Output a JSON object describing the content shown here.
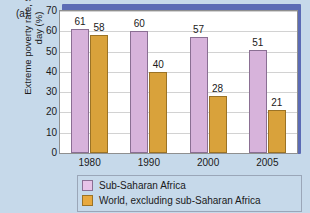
{
  "panel": {
    "label": "(a)"
  },
  "chart_data": {
    "type": "bar",
    "title": "",
    "xlabel": "",
    "ylabel": "Extreme poverty rate, $1.25 per day (%)",
    "categories": [
      "1980",
      "1990",
      "2000",
      "2005"
    ],
    "series": [
      {
        "name": "Sub-Saharan Africa",
        "color": "#d7b3db",
        "values": [
          61,
          60,
          57,
          51
        ]
      },
      {
        "name": "World, excluding sub-Saharan Africa",
        "color": "#d9a23b",
        "values": [
          58,
          40,
          28,
          21
        ]
      }
    ],
    "ylim": [
      0,
      70
    ],
    "yticks": [
      0,
      10,
      20,
      30,
      40,
      50,
      60,
      70
    ],
    "grid": true,
    "legend_position": "bottom"
  },
  "legend": {
    "items": [
      {
        "label": "Sub-Saharan Africa"
      },
      {
        "label": "World, excluding sub-Saharan Africa"
      }
    ]
  }
}
